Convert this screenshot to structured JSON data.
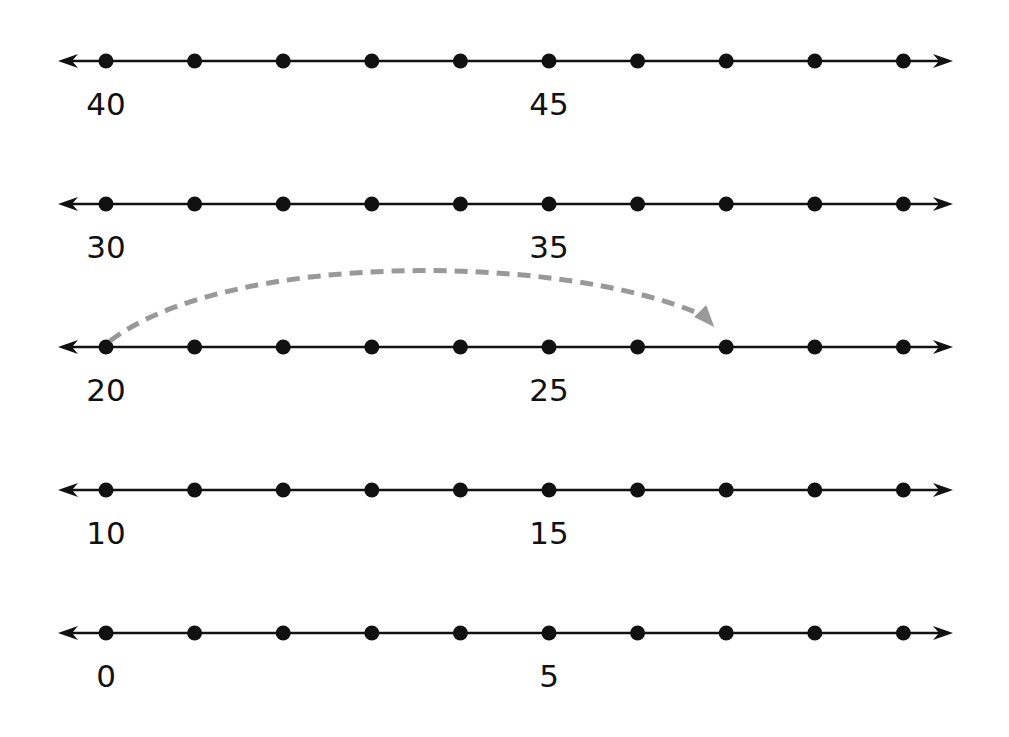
{
  "diagram": {
    "type": "number-lines",
    "colors": {
      "line": "#111111",
      "dot": "#111111",
      "jump_arc": "#999999",
      "background": "#ffffff"
    },
    "geometry": {
      "line_start_x": 58,
      "line_end_x": 953,
      "first_dot_x": 106,
      "dot_spacing": 88.6,
      "dots_per_line": 10
    },
    "lines": [
      {
        "y": 61,
        "start": 40,
        "labels": [
          {
            "index": 0,
            "text": "40"
          },
          {
            "index": 5,
            "text": "45"
          }
        ]
      },
      {
        "y": 204,
        "start": 30,
        "labels": [
          {
            "index": 0,
            "text": "30"
          },
          {
            "index": 5,
            "text": "35"
          }
        ]
      },
      {
        "y": 347,
        "start": 20,
        "labels": [
          {
            "index": 0,
            "text": "20"
          },
          {
            "index": 5,
            "text": "25"
          }
        ]
      },
      {
        "y": 490,
        "start": 10,
        "labels": [
          {
            "index": 0,
            "text": "10"
          },
          {
            "index": 5,
            "text": "15"
          }
        ]
      },
      {
        "y": 633,
        "start": 0,
        "labels": [
          {
            "index": 0,
            "text": "0"
          },
          {
            "index": 5,
            "text": "5"
          }
        ]
      }
    ],
    "jump": {
      "line_index": 2,
      "from_index": 0,
      "to_index": 7,
      "from_value": 20,
      "to_value": 27,
      "style": "dashed-arc"
    }
  }
}
